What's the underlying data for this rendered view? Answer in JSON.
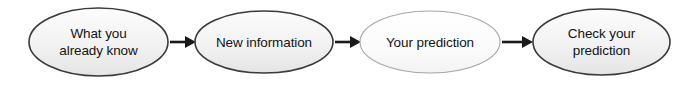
{
  "diagram": {
    "type": "flow-chain",
    "orientation": "horizontal",
    "background_color": "#ffffff",
    "nodes": [
      {
        "id": "what-you-already-know",
        "shape": "ellipse",
        "lines": [
          "What you",
          "already know"
        ],
        "cx": 98.5,
        "cy": 42,
        "rx": 69.5,
        "ry": 34,
        "fill_color": "#f2f2f2",
        "border_color": "#3a3a3a",
        "border_width": 1.6,
        "text_color": "#141414"
      },
      {
        "id": "new-information",
        "shape": "ellipse",
        "lines": [
          "New information"
        ],
        "cx": 264,
        "cy": 42,
        "rx": 69,
        "ry": 31,
        "fill_color": "#f0f0f0",
        "border_color": "#3a3a3a",
        "border_width": 1.6,
        "text_color": "#141414"
      },
      {
        "id": "your-prediction",
        "shape": "ellipse",
        "lines": [
          "Your prediction"
        ],
        "cx": 430,
        "cy": 42,
        "rx": 70,
        "ry": 31,
        "fill_color": "#fbfbfb",
        "border_color": "#a6a6a6",
        "border_width": 1.1,
        "text_color": "#141414"
      },
      {
        "id": "check-your-prediction",
        "shape": "ellipse",
        "lines": [
          "Check your",
          "prediction"
        ],
        "cx": 601.5,
        "cy": 42,
        "rx": 68.5,
        "ry": 33,
        "fill_color": "#f1f1f1",
        "border_color": "#3a3a3a",
        "border_width": 1.6,
        "text_color": "#141414"
      }
    ],
    "arrows": [
      {
        "id": "arrow-1",
        "from": "what-you-already-know",
        "to": "new-information",
        "x1": 170,
        "x2": 195,
        "y": 42,
        "color": "#1a1a1a",
        "stroke_width": 2.6,
        "head_length": 10,
        "head_half_width": 6
      },
      {
        "id": "arrow-2",
        "from": "new-information",
        "to": "your-prediction",
        "x1": 335,
        "x2": 360,
        "y": 42,
        "color": "#1a1a1a",
        "stroke_width": 2.6,
        "head_length": 10,
        "head_half_width": 6
      },
      {
        "id": "arrow-3",
        "from": "your-prediction",
        "to": "check-your-prediction",
        "x1": 502,
        "x2": 533,
        "y": 42,
        "color": "#1a1a1a",
        "stroke_width": 2.6,
        "head_length": 10,
        "head_half_width": 6
      }
    ]
  }
}
